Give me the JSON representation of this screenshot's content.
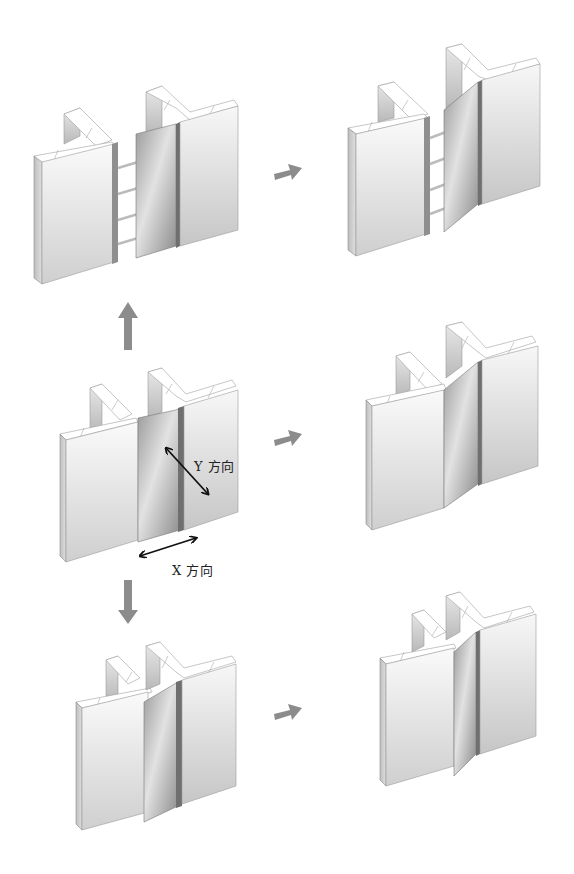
{
  "diagram": {
    "type": "mechanism-illustration",
    "colors": {
      "background": "#ffffff",
      "wall_face_light": "#f4f4f4",
      "wall_face_dark": "#c9c9c9",
      "wall_top": "#ffffff",
      "wall_edge": "#8a8a8a",
      "cover_plate_light": "#d8d8d8",
      "cover_plate_dark": "#8f8f8f",
      "arrow_gray": "#8c8c8c",
      "dimension_arrow": "#111111",
      "label_text": "#222222"
    },
    "labels": {
      "y_direction": "Y 方向",
      "x_direction": "X 方向"
    },
    "scenes": [
      {
        "id": "top-left",
        "state": "joint opened in X (gap widened, spacer bars visible)"
      },
      {
        "id": "top-right",
        "state": "joint opened in X with Y offset (plate rotated)"
      },
      {
        "id": "middle-left",
        "state": "neutral position",
        "annotations": [
          "Y 方向",
          "X 方向"
        ]
      },
      {
        "id": "middle-right",
        "state": "Y-direction displacement (plate angled)"
      },
      {
        "id": "bottom-left",
        "state": "joint closed in X (plate folded)"
      },
      {
        "id": "bottom-right",
        "state": "joint closed in X with Y offset"
      }
    ],
    "arrows": [
      {
        "id": "arrow-up",
        "from": "middle-left",
        "to": "top-left",
        "direction": "up"
      },
      {
        "id": "arrow-down",
        "from": "middle-left",
        "to": "bottom-left",
        "direction": "down"
      },
      {
        "id": "arrow-top-right",
        "from": "top-left",
        "to": "top-right",
        "direction": "right"
      },
      {
        "id": "arrow-middle-right",
        "from": "middle-left",
        "to": "middle-right",
        "direction": "right"
      },
      {
        "id": "arrow-bottom-right",
        "from": "bottom-left",
        "to": "bottom-right",
        "direction": "right"
      }
    ]
  }
}
